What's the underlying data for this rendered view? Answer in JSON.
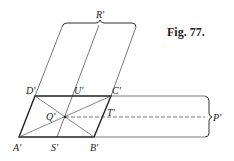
{
  "figure": {
    "caption": "Fig. 77.",
    "labels": {
      "A": "A'",
      "B": "B'",
      "C": "C'",
      "D": "D'",
      "Q": "Q'",
      "R": "R'",
      "S": "S'",
      "T": "T'",
      "U": "U'",
      "P": "P'"
    },
    "colors": {
      "ink": "#222222",
      "thin": "#555555",
      "background": "#ffffff"
    }
  }
}
